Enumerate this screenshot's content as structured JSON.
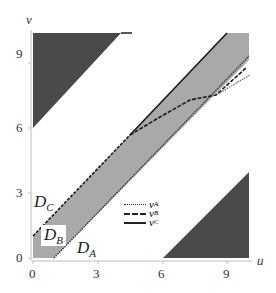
{
  "axes": {
    "x_label": "u",
    "y_label": "v",
    "x_ticks": [
      "0",
      "3",
      "6",
      "9"
    ],
    "y_ticks": [
      "0",
      "3",
      "6",
      "9"
    ],
    "range": [
      0,
      10
    ]
  },
  "regions": {
    "D_A": {
      "label": "D",
      "sub": "A"
    },
    "D_B": {
      "label": "D",
      "sub": "B"
    },
    "D_C": {
      "label": "D",
      "sub": "C"
    }
  },
  "legend": [
    {
      "label": "v",
      "sub": "A",
      "style": "dotted"
    },
    {
      "label": "v",
      "sub": "B",
      "style": "dashed"
    },
    {
      "label": "v",
      "sub": "C",
      "style": "solid"
    }
  ],
  "colors": {
    "band": "#a9a9a9",
    "triangles": "#4a4a4a",
    "axis": "#bdbdbd",
    "line": "#1a1a1a"
  }
}
